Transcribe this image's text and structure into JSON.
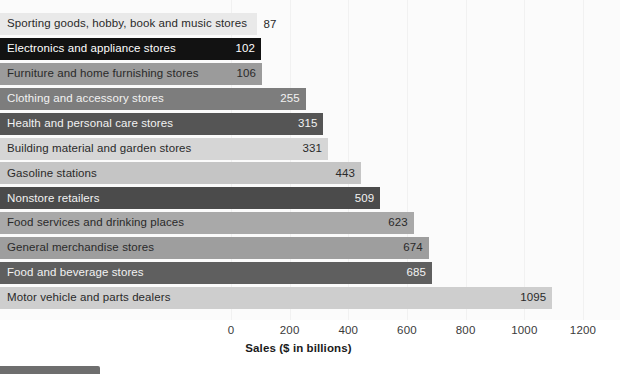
{
  "chart_data": {
    "type": "bar",
    "orientation": "horizontal",
    "title": "",
    "xlabel": "Sales ($ in billions)",
    "ylabel": "",
    "xlim": [
      0,
      1200
    ],
    "xticks": [
      0,
      200,
      400,
      600,
      800,
      1000,
      1200
    ],
    "xtick_labels": [
      "0",
      "200",
      "400",
      "600",
      "800",
      "1000",
      "1200"
    ],
    "grid": true,
    "legend": "none",
    "categories": [
      "Sporting goods, hobby, book and music stores",
      "Electronics and appliance stores",
      "Furniture and home furnishing stores",
      "Clothing and accessory stores",
      "Health and personal care stores",
      "Building material and garden stores",
      "Gasoline stations",
      "Nonstore retailers",
      "Food services and drinking places",
      "General merchandise stores",
      "Food and beverage stores",
      "Motor vehicle and parts dealers"
    ],
    "values": [
      87,
      102,
      106,
      255,
      315,
      331,
      443,
      509,
      623,
      674,
      685,
      1095
    ],
    "bars": [
      {
        "label": "Sporting goods, hobby, book and music stores",
        "value": 87,
        "value_text": "87",
        "fill": "#e9e9e9",
        "text_color": "#2a2a2a",
        "value_inside": false
      },
      {
        "label": "Electronics and appliance stores",
        "value": 102,
        "value_text": "102",
        "fill": "#121212",
        "text_color": "#ffffff",
        "value_inside": true
      },
      {
        "label": "Furniture and home furnishing stores",
        "value": 106,
        "value_text": "106",
        "fill": "#9b9b9b",
        "text_color": "#2a2a2a",
        "value_inside": true
      },
      {
        "label": "Clothing and accessory stores",
        "value": 255,
        "value_text": "255",
        "fill": "#7d7d7d",
        "text_color": "#f2f2f2",
        "value_inside": true
      },
      {
        "label": "Health and personal care stores",
        "value": 315,
        "value_text": "315",
        "fill": "#555555",
        "text_color": "#f2f2f2",
        "value_inside": true
      },
      {
        "label": "Building material and garden stores",
        "value": 331,
        "value_text": "331",
        "fill": "#d6d6d6",
        "text_color": "#2a2a2a",
        "value_inside": true
      },
      {
        "label": "Gasoline stations",
        "value": 443,
        "value_text": "443",
        "fill": "#c5c5c5",
        "text_color": "#2a2a2a",
        "value_inside": true
      },
      {
        "label": "Nonstore retailers",
        "value": 509,
        "value_text": "509",
        "fill": "#4b4b4b",
        "text_color": "#f2f2f2",
        "value_inside": true
      },
      {
        "label": "Food services and drinking places",
        "value": 623,
        "value_text": "623",
        "fill": "#a9a9a9",
        "text_color": "#2a2a2a",
        "value_inside": true
      },
      {
        "label": "General merchandise stores",
        "value": 674,
        "value_text": "674",
        "fill": "#9e9e9e",
        "text_color": "#2a2a2a",
        "value_inside": true
      },
      {
        "label": "Food and beverage stores",
        "value": 685,
        "value_text": "685",
        "fill": "#5f5f5f",
        "text_color": "#f2f2f2",
        "value_inside": true
      },
      {
        "label": "Motor vehicle and parts dealers",
        "value": 1095,
        "value_text": "1095",
        "fill": "#cecece",
        "text_color": "#2a2a2a",
        "value_inside": true
      }
    ]
  },
  "layout": {
    "x_zero_px": 231,
    "px_per_unit": 0.29333,
    "bar_top_px": 13,
    "bar_pitch_px": 24.9,
    "bar_height_px": 22,
    "label_min_bar_px": 232
  },
  "colors": {
    "plot_background": "#fbfbfb",
    "gridline": "#f1f1f1",
    "axis_text": "#3a3a3a",
    "axis_title_text": "#1a1a1a",
    "bottom_tab": "#6e6e6e"
  }
}
